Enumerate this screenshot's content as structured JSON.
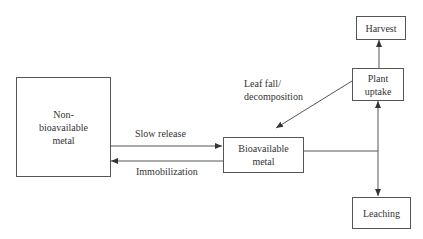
{
  "nodes": {
    "non_bioavailable": {
      "label": "Non-\nbioavailable\nmetal",
      "lines": [
        "Non-",
        "bioavailable",
        "metal"
      ]
    },
    "bioavailable": {
      "label": "Bioavailable metal",
      "lines": [
        "Bioavailable",
        "metal"
      ]
    },
    "plant_uptake": {
      "label": "Plant uptake",
      "lines": [
        "Plant",
        "uptake"
      ]
    },
    "harvest": {
      "label": "Harvest"
    },
    "leaching": {
      "label": "Leaching"
    }
  },
  "edges": {
    "slow_release": {
      "label": "Slow release",
      "from": "Non-bioavailable metal",
      "to": "Bioavailable metal"
    },
    "immobilization": {
      "label": "Immobilization",
      "from": "Bioavailable metal",
      "to": "Non-bioavailable metal"
    },
    "leaf_fall": {
      "label_lines": [
        "Leaf fall/",
        "decomposition"
      ],
      "from": "Plant uptake",
      "to": "Bioavailable metal"
    },
    "to_plant_uptake": {
      "from": "Bioavailable metal",
      "to": "Plant uptake"
    },
    "to_harvest": {
      "from": "Plant uptake",
      "to": "Harvest"
    },
    "to_leaching": {
      "from": "Bioavailable metal",
      "to": "Leaching"
    }
  },
  "colors": {
    "line": "#555555",
    "text": "#333333",
    "background": "#ffffff"
  }
}
